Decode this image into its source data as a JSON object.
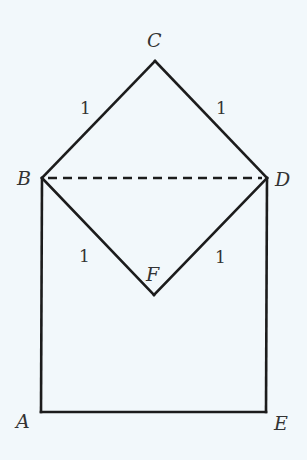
{
  "diagram": {
    "title": "",
    "vertices": {
      "A": {
        "label": "A",
        "x": 41,
        "y": 412
      },
      "B": {
        "label": "B",
        "x": 42,
        "y": 178
      },
      "C": {
        "label": "C",
        "x": 155,
        "y": 61
      },
      "D": {
        "label": "D",
        "x": 267,
        "y": 178
      },
      "E": {
        "label": "E",
        "x": 266,
        "y": 412
      },
      "F": {
        "label": "F",
        "x": 154,
        "y": 295
      }
    },
    "edges": [
      {
        "from": "B",
        "to": "C",
        "style": "solid",
        "length_label": "1"
      },
      {
        "from": "C",
        "to": "D",
        "style": "solid",
        "length_label": "1"
      },
      {
        "from": "B",
        "to": "F",
        "style": "solid",
        "length_label": "1"
      },
      {
        "from": "F",
        "to": "D",
        "style": "solid",
        "length_label": "1"
      },
      {
        "from": "B",
        "to": "A",
        "style": "solid"
      },
      {
        "from": "A",
        "to": "E",
        "style": "solid"
      },
      {
        "from": "E",
        "to": "D",
        "style": "solid"
      },
      {
        "from": "B",
        "to": "D",
        "style": "dashed"
      }
    ],
    "length_labels": {
      "BC": "1",
      "CD": "1",
      "BF": "1",
      "FD": "1"
    },
    "colors": {
      "background": "#f2f8fb",
      "stroke": "#1c1c1c",
      "text": "#333333"
    }
  }
}
